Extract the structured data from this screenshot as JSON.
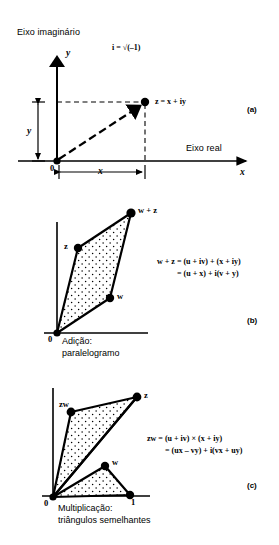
{
  "figure": {
    "ink_color": "#000000",
    "background_color": "#ffffff"
  },
  "panels": [
    {
      "tag": "(a)",
      "axis_labels": {
        "imaginary_axis_name": "Eixo imaginário",
        "real_axis_name": "Eixo real",
        "vertical_axis_var": "y",
        "horizontal_axis_var": "x"
      },
      "origin_label": "0",
      "annotations": {
        "imaginary_unit": "i = √(–1)",
        "point_label": "z = x + iy",
        "x_measure_label": "x",
        "y_measure_label": "y"
      },
      "points": [
        {
          "name": "z",
          "label": "z = x + iy",
          "x": 145,
          "y": 102
        },
        {
          "name": "origin",
          "label": "0",
          "x": 57,
          "y": 161
        }
      ]
    },
    {
      "tag": "(b)",
      "caption_line1": "Adição:",
      "caption_line2": "paralelogramo",
      "origin_label": "0",
      "equation_line1": "w + z = (u + iv) + (x + iy)",
      "equation_line2": "= (u + x) + i(v + y)",
      "points": [
        {
          "name": "z",
          "label": "z",
          "x": 78,
          "y": 248
        },
        {
          "name": "w-plus-z",
          "label": "w + z",
          "x": 131,
          "y": 213
        },
        {
          "name": "w",
          "label": "w",
          "x": 110,
          "y": 298
        },
        {
          "name": "origin",
          "label": "0",
          "x": 57,
          "y": 333
        }
      ]
    },
    {
      "tag": "(c)",
      "caption_line1": "Multiplicação:",
      "caption_line2": "triângulos semelhantes",
      "origin_label": "0",
      "unit_label": "1",
      "equation_line1": "zw = (u + iv) × (x + iy)",
      "equation_line2": "= (ux – vy) + i(vx + uy)",
      "points": [
        {
          "name": "zw",
          "label": "zw",
          "x": 71,
          "y": 412
        },
        {
          "name": "z",
          "label": "z",
          "x": 137,
          "y": 397
        },
        {
          "name": "w",
          "label": "w",
          "x": 105,
          "y": 466
        },
        {
          "name": "unit",
          "label": "1",
          "x": 130,
          "y": 495
        },
        {
          "name": "origin",
          "label": "0",
          "x": 53,
          "y": 497
        }
      ]
    }
  ]
}
